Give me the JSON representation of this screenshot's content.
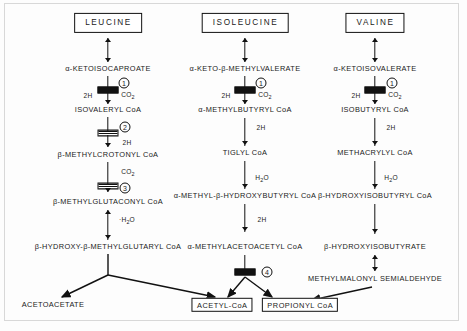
{
  "diagram": {
    "type": "metabolic-pathway-flowchart"
  },
  "columns": [
    {
      "id": "leucine",
      "header": "LEUCINE",
      "steps": [
        "α-KETOISOCAPROATE",
        "ISOVALERYL CoA",
        "β-METHYLCROTONYL CoA",
        "β-METHYLGLUTACONYL CoA",
        "β-HYDROXY-β-METHYLGLUTARYL CoA"
      ]
    },
    {
      "id": "isoleucine",
      "header": "ISOLEUCINE",
      "steps": [
        "α-KETO-β-METHYLVALERATE",
        "α-METHYLBUTYRYL CoA",
        "TIGLYL CoA",
        "α-METHYL-β-HYDROXYBUTYRYL CoA",
        "α-METHYLACETOACETYL CoA"
      ]
    },
    {
      "id": "valine",
      "header": "VALINE",
      "steps": [
        "α-KETOISOVALERATE",
        "ISOBUTYRYL CoA",
        "METHACRYLYL CoA",
        "β-HYDROXYISOBUTYRYL CoA",
        "β-HYDROXYISOBUTYRATE",
        "METHYLMALONYL SEMIALDEHYDE"
      ]
    }
  ],
  "products": [
    {
      "id": "acetoacetate",
      "label": "ACETOACETATE",
      "boxed": false
    },
    {
      "id": "acetyl-coa",
      "label": "ACETYL-CoA",
      "boxed": true
    },
    {
      "id": "propionyl-coa",
      "label": "PROPIONYL CoA",
      "boxed": true
    }
  ],
  "enzymes": [
    {
      "number": "①",
      "plain": "1",
      "column": "leucine",
      "reaction": "α-KETOISOCAPROATE → ISOVALERYL CoA"
    },
    {
      "number": "①",
      "plain": "1",
      "column": "isoleucine",
      "reaction": "α-KETO-β-METHYLVALERATE → α-METHYLBUTYRYL CoA"
    },
    {
      "number": "①",
      "plain": "1",
      "column": "valine",
      "reaction": "α-KETOISOVALERATE → ISOBUTYRYL CoA"
    },
    {
      "number": "②",
      "plain": "2",
      "column": "leucine",
      "reaction": "ISOVALERYL CoA → β-METHYLCROTONYL CoA"
    },
    {
      "number": "③",
      "plain": "3",
      "column": "leucine",
      "reaction": "β-METHYLCROTONYL CoA → β-METHYLGLUTACONYL CoA"
    },
    {
      "number": "④",
      "plain": "4",
      "column": "isoleucine",
      "reaction": "α-METHYLACETOACETYL CoA → ACETYL-CoA + PROPIONYL CoA"
    }
  ],
  "cofactors": {
    "two_h": "2H",
    "co2_text": "CO",
    "co2_sub": "2",
    "water_text": "H",
    "water_sub": "2",
    "water_tail": "O",
    "water_plus": "·H",
    "water_plus_tail": "O"
  },
  "labels": {
    "leu_step1_left": "2H",
    "leu_step1_right": "CO2",
    "leu_step2_right": "2H",
    "leu_step3_right": "CO2",
    "leu_hydration": "·H2O",
    "ile_step1_left": "2H",
    "ile_step1_right": "CO2",
    "ile_step2_right": "2H",
    "ile_step3_right": "H2O",
    "ile_step4_right": "2H",
    "val_step1_left": "2H",
    "val_step1_right": "CO2",
    "val_step2_right": "2H",
    "val_step3_right": "H2O"
  }
}
